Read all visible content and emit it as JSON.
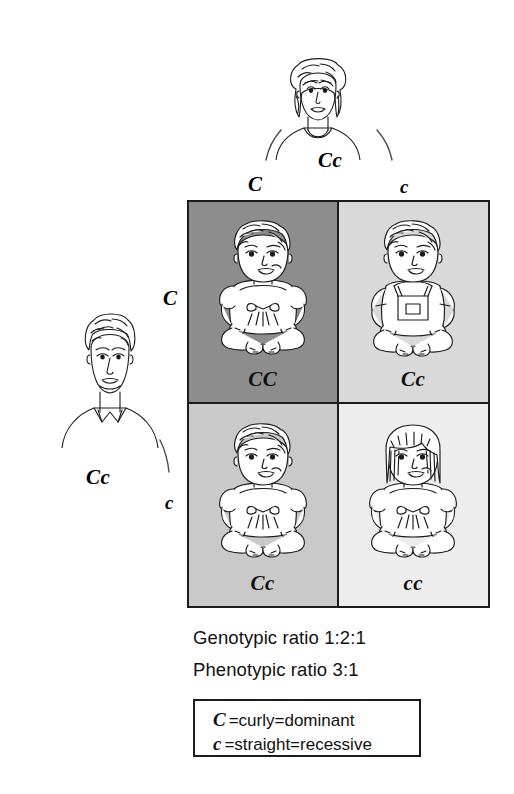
{
  "diagram": {
    "parents": {
      "mother": {
        "label": "Cc",
        "icon": "woman-curly-hair-icon",
        "position": "top"
      },
      "father": {
        "label": "Cc",
        "icon": "man-curly-hair-icon",
        "position": "left"
      }
    },
    "column_headers": [
      "C",
      "c"
    ],
    "row_headers": [
      "C",
      "c"
    ],
    "cells": [
      {
        "genotype": "CC",
        "shade": "#8d8d8d",
        "baby": "baby-curly-dress-icon",
        "row": 0,
        "col": 0
      },
      {
        "genotype": "Cc",
        "shade": "#d9d9d9",
        "baby": "baby-curly-overalls-icon",
        "row": 0,
        "col": 1
      },
      {
        "genotype": "Cc",
        "shade": "#c9c9c9",
        "baby": "baby-curly-dress-icon",
        "row": 1,
        "col": 0
      },
      {
        "genotype": "cc",
        "shade": "#ededed",
        "baby": "baby-straight-dress-icon",
        "row": 1,
        "col": 1
      }
    ],
    "ratios": {
      "genotypic": "Genotypic ratio 1:2:1",
      "phenotypic": "Phenotypic ratio  3:1"
    },
    "legend": [
      {
        "symbol": "C",
        "text": "=curly=dominant"
      },
      {
        "symbol": "c",
        "text": "=straight=recessive"
      }
    ]
  },
  "colors": {
    "ink": "#1b1b1b",
    "background": "#ffffff",
    "shade_dark": "#8d8d8d",
    "shade_mid": "#c9c9c9",
    "shade_light": "#d9d9d9",
    "shade_lightest": "#ededed"
  }
}
